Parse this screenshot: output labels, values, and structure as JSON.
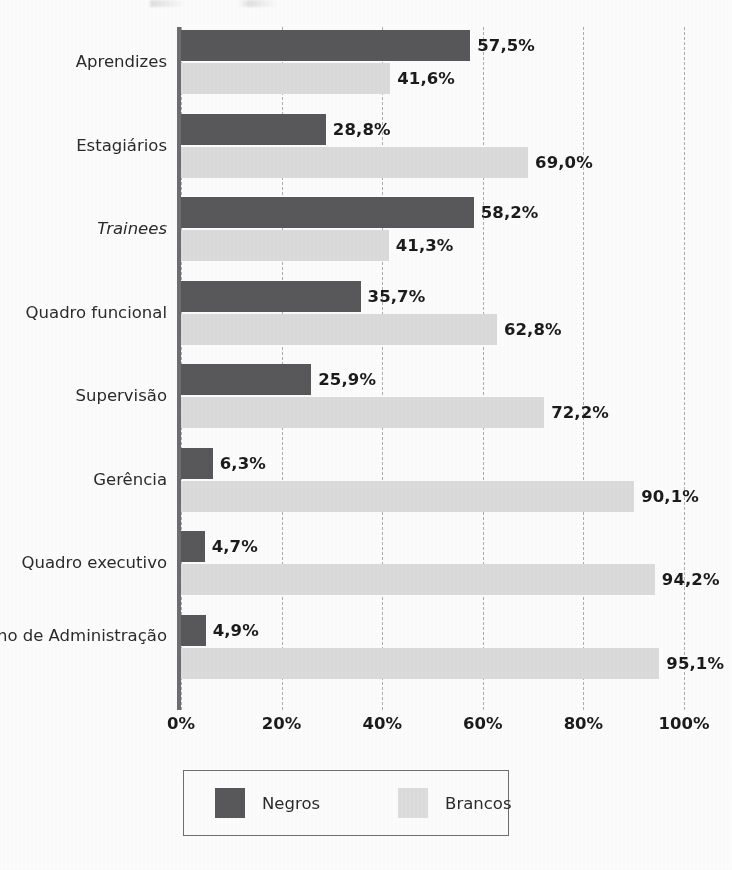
{
  "chart_data": {
    "type": "bar",
    "orientation": "horizontal",
    "title": "",
    "xlabel": "",
    "ylabel": "",
    "xlim": [
      0,
      100
    ],
    "xticks": [
      "0%",
      "20%",
      "40%",
      "60%",
      "80%",
      "100%"
    ],
    "xtick_values": [
      0,
      20,
      40,
      60,
      80,
      100
    ],
    "grid": true,
    "grid_style": "dashed vertical",
    "legend_position": "bottom-center",
    "decimal_separator": ",",
    "categories": [
      "Aprendizes",
      "Estagiários",
      "Trainees",
      "Quadro funcional",
      "Supervisão",
      "Gerência",
      "Quadro executivo",
      "Conselho de Administração"
    ],
    "category_styles": [
      "normal",
      "normal",
      "italic",
      "normal",
      "normal",
      "normal",
      "normal",
      "normal"
    ],
    "series": [
      {
        "name": "Negros",
        "color": "#58585a",
        "values": [
          57.5,
          28.8,
          58.2,
          35.7,
          25.9,
          6.3,
          4.7,
          4.9
        ],
        "labels": [
          "57,5%",
          "28,8%",
          "58,2%",
          "35,7%",
          "25,9%",
          "6,3%",
          "4,7%",
          "4,9%"
        ]
      },
      {
        "name": "Brancos",
        "color": "#dcdcdc",
        "values": [
          41.6,
          69.0,
          41.3,
          62.8,
          72.2,
          90.1,
          94.2,
          95.1
        ],
        "labels": [
          "41,6%",
          "69,0%",
          "41,3%",
          "62,8%",
          "72,2%",
          "90,1%",
          "94,2%",
          "95,1%"
        ]
      }
    ]
  },
  "legend": {
    "items": [
      {
        "label": "Negros",
        "color": "#58585a"
      },
      {
        "label": "Brancos",
        "color": "#dedede"
      }
    ]
  },
  "colors": {
    "negros": "#58585a",
    "brancos": "#dcdcdc",
    "axis": "#6e6e70",
    "gridline": "#aeaeae",
    "text": "#2b2b2b",
    "value_text": "#1b1b1b",
    "background": "#fdfdfd"
  }
}
